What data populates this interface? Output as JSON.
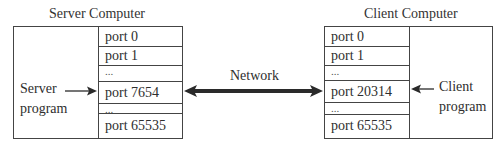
{
  "server": {
    "title": "Server Computer",
    "program_label_line1": "Server",
    "program_label_line2": "program",
    "ports": [
      {
        "label": "port 0"
      },
      {
        "label": "port 1"
      },
      {
        "label": "..."
      },
      {
        "label": "port 7654"
      },
      {
        "label": "..."
      },
      {
        "label": "port 65535"
      }
    ],
    "bound_port": "port 7654"
  },
  "network": {
    "label": "Network",
    "arrow": "bidirectional"
  },
  "client": {
    "title": "Client Computer",
    "program_label_line1": "Client",
    "program_label_line2": "program",
    "ports": [
      {
        "label": "port 0"
      },
      {
        "label": "port 1"
      },
      {
        "label": "..."
      },
      {
        "label": "port 20314"
      },
      {
        "label": "..."
      },
      {
        "label": "port 65535"
      }
    ],
    "bound_port": "port 20314"
  },
  "colors": {
    "line": "#444444",
    "arrow": "#2a2a2a",
    "text": "#2e2e2e",
    "background": "#ffffff"
  }
}
